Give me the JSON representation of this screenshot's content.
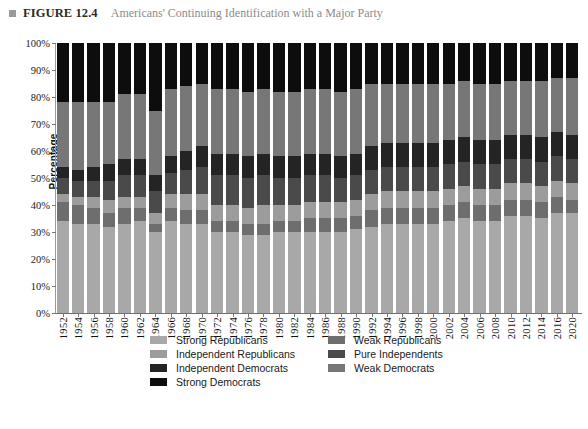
{
  "header": {
    "bullet_icon": "square-bullet-icon",
    "figure_label": "FIGURE 12.4",
    "figure_title": "Americans' Continuing Identification with a Major Party"
  },
  "chart_data": {
    "type": "bar",
    "stacked": true,
    "stack_mode": "percent",
    "title": "Americans' Continuing Identification with a Major Party",
    "xlabel": "",
    "ylabel": "Percentage",
    "ylim": [
      0,
      100
    ],
    "yticks": [
      "0%",
      "10%",
      "20%",
      "30%",
      "40%",
      "50%",
      "60%",
      "70%",
      "80%",
      "90%",
      "100%"
    ],
    "ytick_values": [
      0,
      10,
      20,
      30,
      40,
      50,
      60,
      70,
      80,
      90,
      100
    ],
    "grid": false,
    "legend_position": "bottom",
    "categories": [
      "1952",
      "1954",
      "1956",
      "1958",
      "1960",
      "1962",
      "1964",
      "1966",
      "1968",
      "1970",
      "1972",
      "1974",
      "1976",
      "1978",
      "1980",
      "1982",
      "1984",
      "1986",
      "1988",
      "1990",
      "1992",
      "1994",
      "1996",
      "1998",
      "2000",
      "2002",
      "2004",
      "2006",
      "2008",
      "2010",
      "2012",
      "2014",
      "2016",
      "2020"
    ],
    "stack_order_bottom_to_top": [
      "Strong Republicans",
      "Weak Republicans",
      "Independent Republicans",
      "Pure Independents",
      "Independent Democrats",
      "Weak Democrats",
      "Strong Democrats"
    ],
    "series": [
      {
        "name": "Strong Republicans",
        "color": "#a8a8a8",
        "values": [
          34,
          33,
          33,
          32,
          33,
          34,
          30,
          34,
          33,
          33,
          30,
          30,
          29,
          29,
          30,
          30,
          30,
          30,
          30,
          31,
          32,
          33,
          33,
          33,
          33,
          34,
          35,
          34,
          34,
          36,
          36,
          35,
          37,
          37
        ]
      },
      {
        "name": "Weak Republicans",
        "color": "#6e6e6e",
        "values": [
          7,
          7,
          6,
          5,
          6,
          5,
          3,
          5,
          5,
          5,
          4,
          4,
          4,
          4,
          4,
          4,
          5,
          5,
          5,
          5,
          6,
          6,
          6,
          6,
          6,
          6,
          6,
          6,
          6,
          6,
          6,
          6,
          6,
          5
        ]
      },
      {
        "name": "Independent Republicans",
        "color": "#9c9c9c",
        "values": [
          3,
          3,
          4,
          5,
          4,
          4,
          4,
          5,
          6,
          6,
          6,
          6,
          6,
          7,
          6,
          6,
          6,
          6,
          6,
          6,
          6,
          6,
          6,
          6,
          6,
          6,
          6,
          6,
          6,
          6,
          6,
          6,
          6,
          6
        ]
      },
      {
        "name": "Pure Independents",
        "color": "#4a4a4a",
        "values": [
          6,
          6,
          6,
          7,
          8,
          8,
          8,
          8,
          9,
          10,
          11,
          11,
          11,
          11,
          10,
          10,
          10,
          10,
          9,
          9,
          9,
          9,
          9,
          9,
          9,
          9,
          9,
          9,
          9,
          9,
          9,
          9,
          9,
          9
        ]
      },
      {
        "name": "Independent Democrats",
        "color": "#242424",
        "values": [
          4,
          4,
          5,
          6,
          6,
          6,
          6,
          6,
          7,
          8,
          8,
          8,
          8,
          8,
          8,
          8,
          8,
          8,
          8,
          8,
          9,
          9,
          9,
          9,
          9,
          9,
          9,
          9,
          9,
          9,
          9,
          9,
          9,
          9
        ]
      },
      {
        "name": "Weak Democrats",
        "color": "#777777",
        "values": [
          24,
          25,
          24,
          23,
          24,
          24,
          24,
          25,
          24,
          23,
          24,
          24,
          24,
          24,
          24,
          24,
          24,
          24,
          24,
          24,
          23,
          22,
          22,
          22,
          22,
          21,
          21,
          21,
          21,
          20,
          20,
          21,
          20,
          21
        ]
      },
      {
        "name": "Strong Democrats",
        "color": "#0d0d0d",
        "values": [
          22,
          22,
          22,
          22,
          19,
          19,
          25,
          17,
          16,
          15,
          17,
          17,
          18,
          17,
          18,
          18,
          17,
          17,
          18,
          17,
          15,
          15,
          15,
          15,
          15,
          15,
          14,
          15,
          15,
          14,
          14,
          14,
          13,
          13
        ]
      }
    ]
  },
  "legend": {
    "items": [
      {
        "label": "Strong Republicans",
        "color": "#a8a8a8",
        "col": 0,
        "row": 0
      },
      {
        "label": "Weak Republicans",
        "color": "#6e6e6e",
        "col": 1,
        "row": 0
      },
      {
        "label": "Independent Republicans",
        "color": "#9c9c9c",
        "col": 0,
        "row": 1
      },
      {
        "label": "Pure Independents",
        "color": "#4a4a4a",
        "col": 1,
        "row": 1
      },
      {
        "label": "Independent Democrats",
        "color": "#242424",
        "col": 0,
        "row": 2
      },
      {
        "label": "Weak Democrats",
        "color": "#777777",
        "col": 1,
        "row": 2
      },
      {
        "label": "Strong Democrats",
        "color": "#0d0d0d",
        "col": 0,
        "row": 3
      }
    ]
  }
}
